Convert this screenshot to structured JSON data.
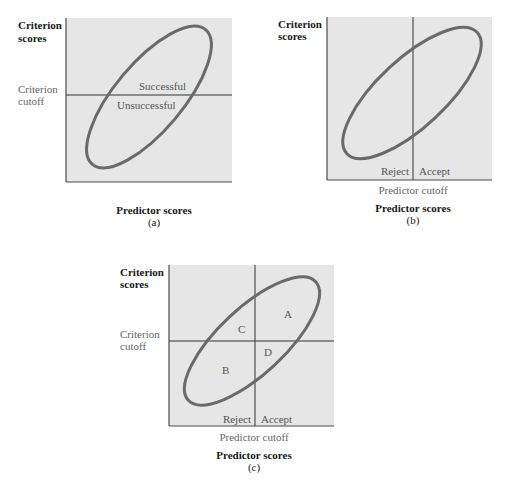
{
  "colors": {
    "plot_fill": "#e6e6e6",
    "axis": "#4a4a4a",
    "cutoff_line": "#333333",
    "ellipse": "#6a6a6a",
    "background": "#ffffff"
  },
  "panels": [
    {
      "id": "a",
      "caption": "(a)",
      "y_axis_label_line1": "Criterion",
      "y_axis_label_line2": "scores",
      "x_axis_label": "Predictor scores",
      "criterion_cutoff_line1": "Criterion",
      "criterion_cutoff_line2": "cutoff",
      "region_above": "Successful",
      "region_below": "Unsuccessful",
      "box": {
        "x": 66,
        "y": 18,
        "w": 166,
        "h": 164
      },
      "criterion_cutoff_y": 95,
      "ellipse": {
        "cx": 149,
        "cy": 97,
        "rx": 88,
        "ry": 35,
        "rotate": -50
      }
    },
    {
      "id": "b",
      "caption": "(b)",
      "y_axis_label_line1": "Criterion",
      "y_axis_label_line2": "scores",
      "x_axis_label": "Predictor scores",
      "predictor_cutoff_label": "Predictor cutoff",
      "left_region": "Reject",
      "right_region": "Accept",
      "box": {
        "x": 327,
        "y": 17,
        "w": 165,
        "h": 163
      },
      "predictor_cutoff_x": 413,
      "ellipse": {
        "cx": 411,
        "cy": 93,
        "rx": 90,
        "ry": 35,
        "rotate": -43
      }
    },
    {
      "id": "c",
      "caption": "(c)",
      "y_axis_label_line1": "Criterion",
      "y_axis_label_line2": "scores",
      "x_axis_label": "Predictor scores",
      "criterion_cutoff_line1": "Criterion",
      "criterion_cutoff_line2": "cutoff",
      "predictor_cutoff_label": "Predictor cutoff",
      "left_region": "Reject",
      "right_region": "Accept",
      "quadrants": {
        "A": "A",
        "B": "B",
        "C": "C",
        "D": "D"
      },
      "box": {
        "x": 169,
        "y": 265,
        "w": 165,
        "h": 161
      },
      "predictor_cutoff_x": 255,
      "criterion_cutoff_y": 341,
      "ellipse": {
        "cx": 251,
        "cy": 340,
        "rx": 88,
        "ry": 34,
        "rotate": -43
      }
    }
  ]
}
